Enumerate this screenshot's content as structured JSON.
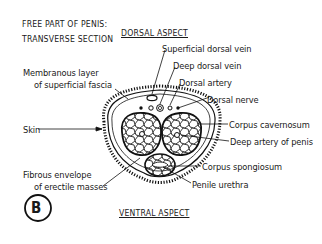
{
  "diagram": {
    "title_line1": "FREE PART OF PENIS:",
    "title_line2": "TRANSVERSE SECTION",
    "panel_letter": "B",
    "aspects": {
      "dorsal": "DORSAL ASPECT",
      "ventral": "VENTRAL ASPECT"
    },
    "labels_left": [
      {
        "text": "Membranous layer",
        "x": 23,
        "y": 72
      },
      {
        "text": "of superficial fascia",
        "x": 34,
        "y": 83
      },
      {
        "text": "Skin",
        "x": 23,
        "y": 126
      },
      {
        "text": "Fibrous envelope",
        "x": 23,
        "y": 170
      },
      {
        "text": "of erectile masses",
        "x": 34,
        "y": 181
      }
    ],
    "labels_right": [
      {
        "text": "Superficial dorsal vein",
        "x": 162,
        "y": 43
      },
      {
        "text": "Deep dorsal vein",
        "x": 173,
        "y": 60
      },
      {
        "text": "Dorsal artery",
        "x": 179,
        "y": 77
      },
      {
        "text": "Dorsal nerve",
        "x": 207,
        "y": 94
      },
      {
        "text": "Corpus cavernosum",
        "x": 229,
        "y": 120
      },
      {
        "text": "Deep artery of penis",
        "x": 230,
        "y": 137
      },
      {
        "text": "Corpus spongiosum",
        "x": 202,
        "y": 162
      },
      {
        "text": "Penile urethra",
        "x": 192,
        "y": 180
      }
    ]
  }
}
